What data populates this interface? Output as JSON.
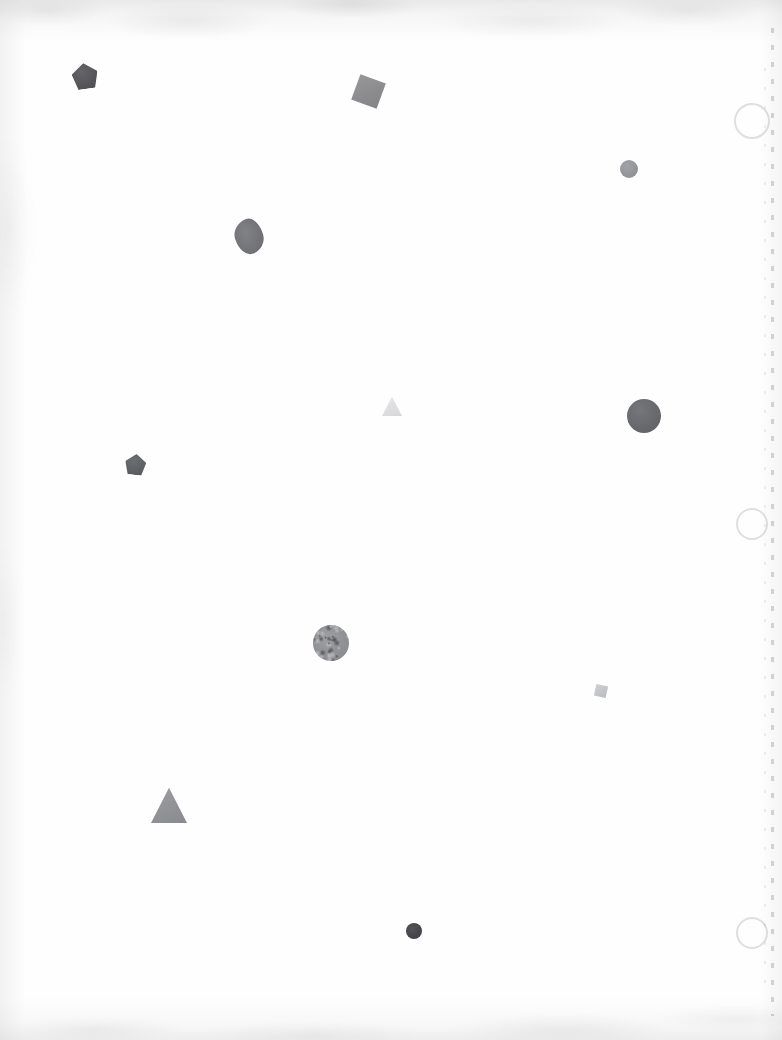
{
  "canvas": {
    "width": 782,
    "height": 1040,
    "background_color": "#ffffff",
    "description": "Scanned white sheet with scattered grayscale geometric shapes"
  },
  "paper": {
    "base_color": "#fefefe",
    "vignette_color": "#96969b",
    "grain_color": "#78787f"
  },
  "edge_marks": {
    "dash_color": "#696970",
    "primary_x": 771,
    "secondary_x": 764,
    "top": 28,
    "bottom": 24
  },
  "rings": [
    {
      "name": "faint-ring-top",
      "cx": 750,
      "cy": 119,
      "r": 16,
      "color": "#96989e"
    },
    {
      "name": "faint-ring-middle",
      "cx": 750,
      "cy": 522,
      "r": 14,
      "color": "#96989e"
    },
    {
      "name": "faint-ring-bottom",
      "cx": 750,
      "cy": 931,
      "r": 14,
      "color": "#96989e"
    }
  ],
  "shapes": [
    {
      "id": "pentagon-dark-top-left",
      "type": "pentagon",
      "cx": 85,
      "cy": 76,
      "size": 26,
      "rotation": -8,
      "color": "#4e4e52",
      "opacity": 0.96
    },
    {
      "id": "square-gray-top-center",
      "type": "square",
      "cx": 368,
      "cy": 91,
      "size": 27,
      "rotation": 20,
      "color": "#868688",
      "opacity": 0.95
    },
    {
      "id": "circle-small-gray-top-right",
      "type": "circle",
      "cx": 629,
      "cy": 169,
      "size": 18,
      "rotation": 0,
      "color": "#8e9093",
      "opacity": 0.95
    },
    {
      "id": "blob-dark-upper-left",
      "type": "blob",
      "cx": 249,
      "cy": 236,
      "size": 28,
      "rotation": -18,
      "color": "#6b6c70",
      "opacity": 0.95
    },
    {
      "id": "triangle-pale-center",
      "type": "triangle",
      "cx": 392,
      "cy": 406,
      "size": 20,
      "rotation": 0,
      "color": "#dedee0",
      "opacity": 1
    },
    {
      "id": "circle-large-right",
      "type": "circle",
      "cx": 644,
      "cy": 416,
      "size": 34,
      "rotation": 0,
      "color": "#636468",
      "opacity": 0.97
    },
    {
      "id": "pentagon-dark-left",
      "type": "pentagon",
      "cx": 135,
      "cy": 464,
      "size": 21,
      "rotation": 6,
      "color": "#57585c",
      "opacity": 0.96
    },
    {
      "id": "circle-noisy-center",
      "type": "noisy-circle",
      "cx": 331,
      "cy": 643,
      "size": 36,
      "rotation": 0,
      "color": "#8c8d90",
      "opacity": 1
    },
    {
      "id": "square-pale-right",
      "type": "square",
      "cx": 601,
      "cy": 691,
      "size": 12,
      "rotation": 12,
      "color": "#c3c4c7",
      "opacity": 1
    },
    {
      "id": "triangle-gray-lower-left",
      "type": "triangle",
      "cx": 169,
      "cy": 805,
      "size": 36,
      "rotation": 0,
      "color": "#8e8f92",
      "opacity": 0.97
    },
    {
      "id": "circle-small-dark-bottom",
      "type": "circle",
      "cx": 414,
      "cy": 931,
      "size": 16,
      "rotation": 0,
      "color": "#3f4043",
      "opacity": 0.97
    }
  ]
}
